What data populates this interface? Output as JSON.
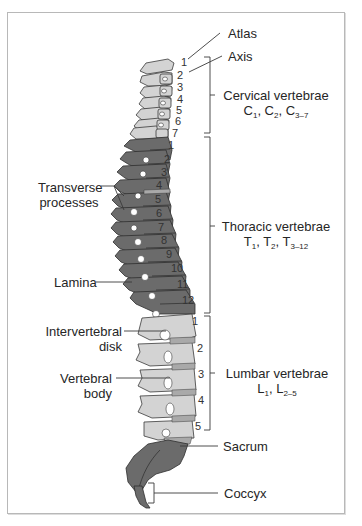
{
  "diagram": {
    "colors": {
      "light_bone": "#d3d3d3",
      "dark_bone": "#6b6b6b",
      "outline": "#3a3a3a",
      "disk": "#a9a9a9",
      "frame": "#b8b8b8",
      "text": "#262626"
    },
    "right_labels": {
      "atlas": "Atlas",
      "axis": "Axis",
      "cervical": {
        "name": "Cervical vertebrae",
        "formula_parts": [
          "C",
          "1",
          ", C",
          "2",
          ", C",
          "3–7"
        ]
      },
      "thoracic": {
        "name": "Thoracic vertebrae",
        "formula_parts": [
          "T",
          "1",
          ", T",
          "2",
          ", T",
          "3–12"
        ]
      },
      "lumbar": {
        "name": "Lumbar vertebrae",
        "formula_parts": [
          "L",
          "1",
          ", L",
          "2–5"
        ]
      },
      "sacrum": "Sacrum",
      "coccyx": "Coccyx"
    },
    "left_labels": {
      "transverse": [
        "Transverse",
        "processes"
      ],
      "lamina": "Lamina",
      "intervertebral": [
        "Intervertebral",
        "disk"
      ],
      "vertebral_body": [
        "Vertebral",
        "body"
      ]
    },
    "cervical_numbers": [
      "1",
      "2",
      "3",
      "4",
      "5",
      "6",
      "7"
    ],
    "thoracic_numbers": [
      "1",
      "2",
      "3",
      "4",
      "5",
      "6",
      "7",
      "8",
      "9",
      "10",
      "11",
      "12"
    ],
    "lumbar_numbers": [
      "1",
      "2",
      "3",
      "4",
      "5"
    ]
  }
}
